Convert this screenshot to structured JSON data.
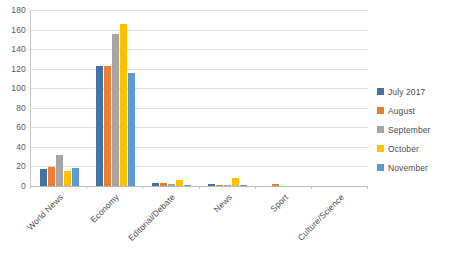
{
  "chart_data": {
    "type": "bar",
    "title": "",
    "xlabel": "",
    "ylabel": "",
    "ylim": [
      0,
      180
    ],
    "ytick_step": 20,
    "yticks": [
      0,
      20,
      40,
      60,
      80,
      100,
      120,
      140,
      160,
      180
    ],
    "grid": true,
    "legend_position": "right",
    "categories": [
      "World News",
      "Economy",
      "Editorial/Debate",
      "News",
      "Sport",
      "Culture/Science"
    ],
    "series": [
      {
        "name": "July 2017",
        "color": "#4472A4",
        "values": [
          17,
          123,
          3,
          2,
          0,
          0
        ]
      },
      {
        "name": "August",
        "color": "#ED7D31",
        "values": [
          19,
          123,
          3,
          1,
          2,
          0
        ]
      },
      {
        "name": "September",
        "color": "#A5A5A5",
        "values": [
          32,
          155,
          2,
          1,
          0,
          0
        ]
      },
      {
        "name": "October",
        "color": "#FFC000",
        "values": [
          15,
          166,
          6,
          8,
          0,
          0
        ]
      },
      {
        "name": "November",
        "color": "#5B9BD5",
        "values": [
          18,
          116,
          1,
          1,
          0,
          0
        ]
      }
    ]
  }
}
